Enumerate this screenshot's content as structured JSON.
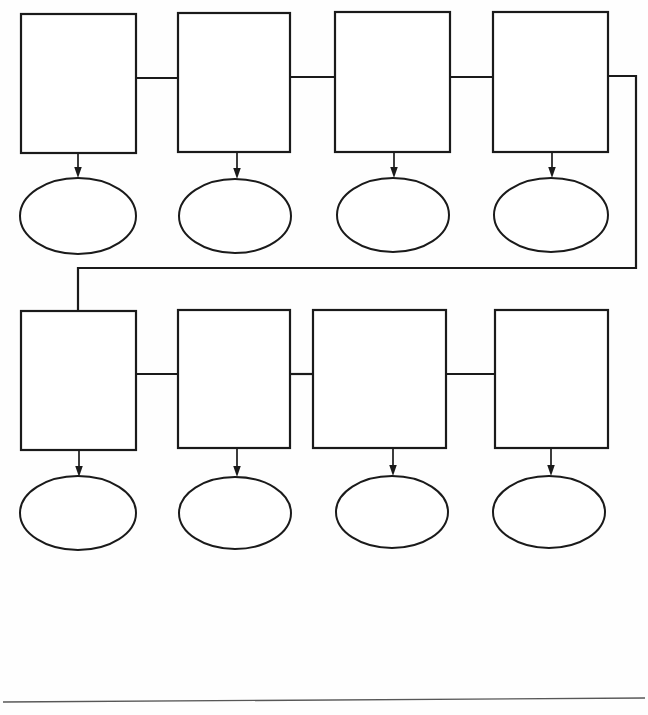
{
  "page": {
    "width": 648,
    "height": 715,
    "background_color": "#fefefe",
    "ink_color": "#1a1a1a",
    "rule_color": "#575757"
  },
  "diagram": {
    "type": "flowchart",
    "row_count": 2,
    "columns_per_row": 4,
    "boxes_total": 8,
    "ovals_total": 8,
    "rows": [
      {
        "row_index": 1,
        "boxes": [
          {
            "id": "box-r1-c1",
            "label": "",
            "x": 21,
            "y": 14,
            "w": 115,
            "h": 139
          },
          {
            "id": "box-r1-c2",
            "label": "",
            "x": 178,
            "y": 13,
            "w": 112,
            "h": 139
          },
          {
            "id": "box-r1-c3",
            "label": "",
            "x": 335,
            "y": 12,
            "w": 115,
            "h": 140
          },
          {
            "id": "box-r1-c4",
            "label": "",
            "x": 493,
            "y": 12,
            "w": 115,
            "h": 140
          }
        ],
        "ovals": [
          {
            "id": "oval-r1-c1",
            "label": "",
            "cx": 78,
            "cy": 216,
            "rx": 58,
            "ry": 38
          },
          {
            "id": "oval-r1-c2",
            "label": "",
            "cx": 235,
            "cy": 216,
            "rx": 56,
            "ry": 37
          },
          {
            "id": "oval-r1-c3",
            "label": "",
            "cx": 393,
            "cy": 215,
            "rx": 56,
            "ry": 37
          },
          {
            "id": "oval-r1-c4",
            "label": "",
            "cx": 551,
            "cy": 215,
            "rx": 57,
            "ry": 37
          }
        ],
        "horizontal_links": [
          {
            "from": "box-r1-c1",
            "to": "box-r1-c2",
            "y": 78
          },
          {
            "from": "box-r1-c2",
            "to": "box-r1-c3",
            "y": 77
          },
          {
            "from": "box-r1-c3",
            "to": "box-r1-c4",
            "y": 77
          }
        ]
      },
      {
        "row_index": 2,
        "boxes": [
          {
            "id": "box-r2-c1",
            "label": "",
            "x": 21,
            "y": 311,
            "w": 115,
            "h": 139
          },
          {
            "id": "box-r2-c2",
            "label": "",
            "x": 178,
            "y": 310,
            "w": 112,
            "h": 138
          },
          {
            "id": "box-r2-c3",
            "label": "",
            "x": 313,
            "y": 310,
            "w": 133,
            "h": 138
          },
          {
            "id": "box-r2-c4",
            "label": "",
            "x": 495,
            "y": 310,
            "w": 113,
            "h": 138
          }
        ],
        "ovals": [
          {
            "id": "oval-r2-c1",
            "label": "",
            "cx": 78,
            "cy": 513,
            "rx": 58,
            "ry": 37
          },
          {
            "id": "oval-r2-c2",
            "label": "",
            "cx": 235,
            "cy": 513,
            "rx": 56,
            "ry": 36
          },
          {
            "id": "oval-r2-c3",
            "label": "",
            "cx": 392,
            "cy": 512,
            "rx": 56,
            "ry": 36
          },
          {
            "id": "oval-r2-c4",
            "label": "",
            "cx": 549,
            "cy": 512,
            "rx": 56,
            "ry": 36
          }
        ],
        "horizontal_links": [
          {
            "from": "box-r2-c1",
            "to": "box-r2-c2",
            "y": 374
          },
          {
            "from": "box-r2-c2",
            "to": "box-r2-c3",
            "y": 374
          },
          {
            "from": "box-r2-c3",
            "to": "box-r2-c4",
            "y": 374
          }
        ]
      }
    ],
    "wrap_connector": {
      "id": "wrap-connector-row1-to-row2",
      "from": "box-r1-c4",
      "to": "box-r2-c1",
      "path": "M 608 76 L 636 76 L 636 268 L 78 268 L 78 311",
      "corner_right_x": 636,
      "corner_top_y": 76,
      "corner_bottom_y": 268,
      "drop_x": 78
    },
    "arrows": [
      {
        "id": "arrow-r1-c1",
        "from": "box-r1-c1",
        "to": "oval-r1-c1",
        "x": 78,
        "y1": 153,
        "y2": 178
      },
      {
        "id": "arrow-r1-c2",
        "from": "box-r1-c2",
        "to": "oval-r1-c2",
        "x": 237,
        "y1": 152,
        "y2": 179
      },
      {
        "id": "arrow-r1-c3",
        "from": "box-r1-c3",
        "to": "oval-r1-c3",
        "x": 394,
        "y1": 152,
        "y2": 178
      },
      {
        "id": "arrow-r1-c4",
        "from": "box-r1-c4",
        "to": "oval-r1-c4",
        "x": 552,
        "y1": 152,
        "y2": 178
      },
      {
        "id": "arrow-r2-c1",
        "from": "box-r2-c1",
        "to": "oval-r2-c1",
        "x": 79,
        "y1": 450,
        "y2": 477
      },
      {
        "id": "arrow-r2-c2",
        "from": "box-r2-c2",
        "to": "oval-r2-c2",
        "x": 237,
        "y1": 448,
        "y2": 477
      },
      {
        "id": "arrow-r2-c3",
        "from": "box-r2-c3",
        "to": "oval-r2-c3",
        "x": 393,
        "y1": 448,
        "y2": 476
      },
      {
        "id": "arrow-r2-c4",
        "from": "box-r2-c4",
        "to": "oval-r2-c4",
        "x": 551,
        "y1": 448,
        "y2": 476
      }
    ],
    "footer_rule": {
      "id": "footer-rule",
      "x1": 3,
      "y1": 702,
      "x2": 645,
      "y2": 698
    }
  }
}
